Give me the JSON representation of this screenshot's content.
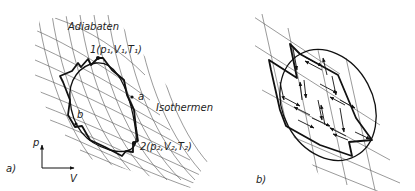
{
  "panel_a": {
    "label": "a)",
    "adiabats_label": "Adiabaten",
    "isotherms_label": "Isothermen",
    "state1_label": "1(p₁,V₁,T₁)",
    "state2_label": "2(p₂,V₂,T₂)",
    "path_a_label": "a",
    "path_b_label": "b",
    "axis_y_label": "p",
    "axis_x_label": "V"
  },
  "panel_b": {
    "label": "b)"
  }
}
